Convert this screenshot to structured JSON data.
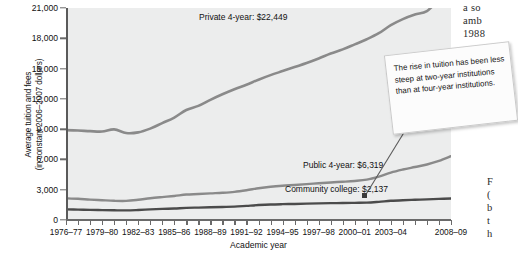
{
  "chart_data": {
    "type": "line",
    "title": "",
    "xlabel": "Academic year",
    "ylabel_line1": "Average tuition and fees",
    "ylabel_line2": "(in constant 2006–2007 dollars)",
    "ylim": [
      0,
      21000
    ],
    "yticks": [
      "0",
      "3,000",
      "6,000",
      "9,000",
      "12,000",
      "15,000",
      "18,000",
      "21,000"
    ],
    "ytick_values": [
      0,
      3000,
      6000,
      9000,
      12000,
      15000,
      18000,
      21000
    ],
    "grid": false,
    "legend_position": "inline-labels",
    "x": [
      "1976–77",
      "1977–78",
      "1978–79",
      "1979–80",
      "1980–81",
      "1981–82",
      "1982–83",
      "1983–84",
      "1984–85",
      "1985–86",
      "1986–87",
      "1987–88",
      "1988–89",
      "1989–90",
      "1990–91",
      "1991–92",
      "1992–93",
      "1993–94",
      "1994–95",
      "1995–96",
      "1996–97",
      "1997–98",
      "1998–99",
      "1999–00",
      "2000–01",
      "2001–02",
      "2002–03",
      "2003–04",
      "2004–05",
      "2005–06",
      "2006–07",
      "2007–08",
      "2008–09"
    ],
    "xtick_labels": [
      "1976–77",
      "1979–80",
      "1982–83",
      "1985–86",
      "1988–89",
      "1991–92",
      "1994–95",
      "1997–98",
      "2000–01",
      "2003–04",
      "2008–09"
    ],
    "xtick_label_indices": [
      0,
      3,
      6,
      9,
      12,
      15,
      18,
      21,
      24,
      27,
      32
    ],
    "series": [
      {
        "name": "Private 4-year",
        "end_label": "Private 4-year: $22,449",
        "end_value": 22449,
        "color": "#8a8a8a",
        "values": [
          8900,
          8860,
          8800,
          8760,
          8980,
          8620,
          8680,
          9050,
          9600,
          10150,
          10900,
          11300,
          11900,
          12450,
          12950,
          13400,
          13900,
          14350,
          14750,
          15150,
          15550,
          16000,
          16500,
          16900,
          17400,
          17900,
          18500,
          19300,
          19900,
          20350,
          20700,
          21800,
          22449
        ]
      },
      {
        "name": "Public 4-year",
        "end_label": "Public 4-year: $6,319",
        "end_value": 6319,
        "color": "#8a8a8a",
        "values": [
          2150,
          2100,
          2020,
          1960,
          1900,
          1890,
          2000,
          2150,
          2270,
          2380,
          2520,
          2570,
          2640,
          2700,
          2790,
          2950,
          3150,
          3300,
          3400,
          3470,
          3550,
          3640,
          3720,
          3790,
          3870,
          4000,
          4300,
          4700,
          5000,
          5250,
          5500,
          5850,
          6319
        ]
      },
      {
        "name": "Community college",
        "end_label": "Community college: $2,137",
        "end_value": 2137,
        "color": "#4b4b4b",
        "values": [
          1050,
          1030,
          1000,
          980,
          960,
          950,
          990,
          1050,
          1100,
          1140,
          1200,
          1230,
          1260,
          1290,
          1320,
          1400,
          1480,
          1540,
          1570,
          1590,
          1620,
          1650,
          1670,
          1680,
          1700,
          1720,
          1800,
          1900,
          1960,
          2000,
          2040,
          2090,
          2137
        ]
      }
    ],
    "annotation": {
      "text": "The rise in tuition has been less steep at two-year institutions than at four-year institutions.",
      "points_to": "Community college"
    }
  },
  "margin_text": {
    "top": [
      "a  so",
      "amb",
      "1988"
    ],
    "bottom": [
      "F",
      "(",
      "b",
      "t",
      "h"
    ]
  }
}
